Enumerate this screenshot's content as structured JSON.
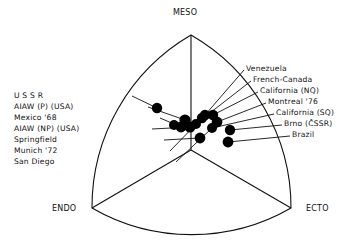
{
  "figure": {
    "type": "somatochart",
    "background_color": "#ffffff",
    "ink_color": "#111111",
    "point_color": "#000000"
  },
  "axes": {
    "apex_labels": [
      {
        "id": "meso",
        "text": "MESO",
        "position": "top",
        "x": 173,
        "y": 8
      },
      {
        "id": "endo",
        "text": "ENDO",
        "position": "bottom-left",
        "x": 52,
        "y": 204
      },
      {
        "id": "ecto",
        "text": "ECTO",
        "position": "bottom-right",
        "x": 306,
        "y": 204
      }
    ]
  },
  "left_labels": [
    {
      "id": "ussr",
      "text": "U S S R",
      "x": 14,
      "y": 91,
      "anchor_x": 132,
      "anchor_y": 96,
      "point_x": 157,
      "point_y": 108
    },
    {
      "id": "aiaw-p-usa",
      "text": "AIAW (P) (USA)",
      "x": 14,
      "y": 102,
      "anchor_x": 148,
      "anchor_y": 107,
      "point_x": 185,
      "point_y": 120
    },
    {
      "id": "mexico-68",
      "text": "Mexico '68",
      "x": 14,
      "y": 113,
      "anchor_x": 160,
      "anchor_y": 118,
      "point_x": 181,
      "point_y": 127
    },
    {
      "id": "aiaw-np-usa",
      "text": "AIAW (NP) (USA)",
      "x": 14,
      "y": 124,
      "anchor_x": 152,
      "anchor_y": 129,
      "point_x": 190,
      "point_y": 127
    },
    {
      "id": "springfield",
      "text": "Springfield",
      "x": 14,
      "y": 135,
      "anchor_x": 164,
      "anchor_y": 140,
      "point_x": 200,
      "point_y": 138
    },
    {
      "id": "munich-72",
      "text": "Munich '72",
      "x": 14,
      "y": 146,
      "anchor_x": 170,
      "anchor_y": 151,
      "point_x": 202,
      "point_y": 118
    },
    {
      "id": "san-diego",
      "text": "San Diego",
      "x": 14,
      "y": 157,
      "anchor_x": 176,
      "anchor_y": 162,
      "point_x": 212,
      "point_y": 128
    }
  ],
  "right_labels": [
    {
      "id": "venezuela",
      "text": "Venezuela",
      "x": 246,
      "y": 64,
      "anchor_x": 244,
      "anchor_y": 70,
      "point_x": 205,
      "point_y": 115
    },
    {
      "id": "french-canada",
      "text": "French-Canada",
      "x": 253,
      "y": 75,
      "anchor_x": 251,
      "anchor_y": 81,
      "point_x": 206,
      "point_y": 116
    },
    {
      "id": "california-nq",
      "text": "California (NQ)",
      "x": 260,
      "y": 86,
      "anchor_x": 258,
      "anchor_y": 92,
      "point_x": 213,
      "point_y": 115
    },
    {
      "id": "montreal-76",
      "text": "Montreal '76",
      "x": 268,
      "y": 97,
      "anchor_x": 266,
      "anchor_y": 103,
      "point_x": 217,
      "point_y": 122
    },
    {
      "id": "california-sq",
      "text": "California (SQ)",
      "x": 276,
      "y": 108,
      "anchor_x": 274,
      "anchor_y": 114,
      "point_x": 212,
      "point_y": 128
    },
    {
      "id": "brno-cssr",
      "text": "Brno (ČSSR)",
      "x": 284,
      "y": 119,
      "anchor_x": 282,
      "anchor_y": 125,
      "point_x": 230,
      "point_y": 130
    },
    {
      "id": "brazil",
      "text": "Brazil",
      "x": 292,
      "y": 130,
      "anchor_x": 290,
      "anchor_y": 136,
      "point_x": 228,
      "point_y": 142
    }
  ],
  "chart_data": {
    "type": "scatter",
    "title": "",
    "xlabel": "",
    "ylabel": "",
    "axes_names": [
      "ENDO",
      "MESO",
      "ECTO"
    ],
    "coordinate_system": "Reuleaux triangle somatochart (3 somatotype poles)",
    "geometry": {
      "apex_meso": [
        191,
        35
      ],
      "apex_endo": [
        92,
        208
      ],
      "apex_ecto": [
        291,
        208
      ],
      "centroid": [
        191,
        150
      ],
      "arc_radius": 199
    },
    "grid": false,
    "legend": "leader-line callouts, left and right",
    "points": [
      {
        "label": "U S S R",
        "x": 157,
        "y": 108,
        "r": 5.2
      },
      {
        "label": "Venezuela",
        "x": 205,
        "y": 115,
        "r": 5.2
      },
      {
        "label": "California (NQ)",
        "x": 213,
        "y": 115,
        "r": 5.2
      },
      {
        "label": "Munich '72",
        "x": 202,
        "y": 118,
        "r": 5.2
      },
      {
        "label": "AIAW (P) (USA)",
        "x": 185,
        "y": 120,
        "r": 5.6
      },
      {
        "label": "Montreal '76",
        "x": 217,
        "y": 122,
        "r": 5.4
      },
      {
        "label": "Mexico '68",
        "x": 181,
        "y": 127,
        "r": 5.4
      },
      {
        "label": "AIAW (NP) (USA)",
        "x": 190,
        "y": 127,
        "r": 5.6
      },
      {
        "label": "California (SQ)",
        "x": 212,
        "y": 128,
        "r": 5.0
      },
      {
        "label": "Brno (ČSSR)",
        "x": 230,
        "y": 130,
        "r": 5.2
      },
      {
        "label": "Springfield",
        "x": 200,
        "y": 138,
        "r": 5.4
      },
      {
        "label": "Brazil",
        "x": 228,
        "y": 142,
        "r": 5.4
      },
      {
        "label": "French-Canada",
        "x": 174,
        "y": 125,
        "r": 5.0
      },
      {
        "label": "San Diego",
        "x": 196,
        "y": 124,
        "r": 5.0
      }
    ],
    "point_count": 14
  }
}
